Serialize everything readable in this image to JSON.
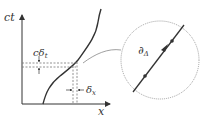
{
  "diagram": {
    "colors": {
      "line": "#333333",
      "dashed": "#777777",
      "circle": "#888888"
    },
    "axes": {
      "y_label": "ct",
      "x_label": "x"
    },
    "annotations": {
      "time_interval": "cδ",
      "time_interval_sub": "t",
      "space_interval": "δ",
      "space_interval_sub": "x"
    },
    "inset": {
      "label": "∂",
      "label_sub": "Δ"
    }
  }
}
